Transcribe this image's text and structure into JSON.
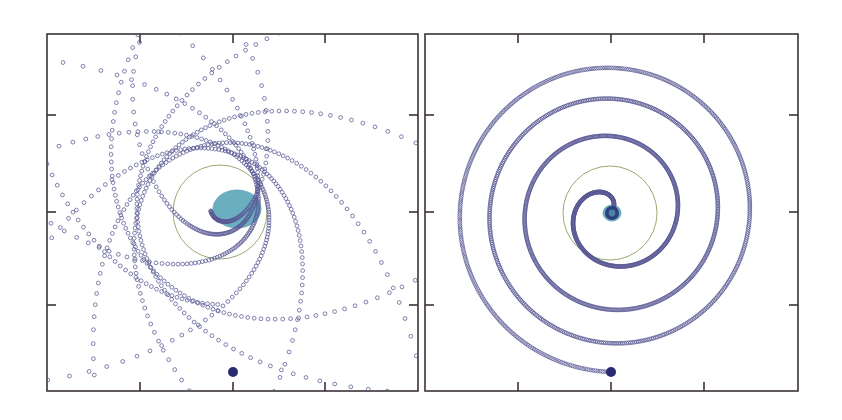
{
  "figure": {
    "caption": "",
    "background_color": "#ffffff",
    "width": 842,
    "height": 420
  },
  "style": {
    "axis_color": "#3a3338",
    "axis_width": 1.6,
    "tick_length": 9,
    "marker_color": "#6a6aa0",
    "marker_stroke_color": "#5a5a95",
    "marker_radius": 1.9,
    "marker_stroke_width": 0.85,
    "start_marker_color": "#2a2a72",
    "start_marker_radius": 5.0,
    "central_body_color": "#6aaec0",
    "central_body_edge_color": "#5d9fb2",
    "reference_circle_color": "#8a9a5a",
    "reference_circle_width": 1.0,
    "inner_core_color": "#2a3a78"
  },
  "chart_data": [
    {
      "id": "left-panel",
      "type": "scatter",
      "title": "",
      "subtitle": "",
      "xlabel": "",
      "ylabel": "",
      "description": "Precessing rosette orbit decaying onto a central body; open-circle markers trace successive eccentric lobes sharing a common focus.",
      "grid": false,
      "legend": null,
      "tick_labels_x": [],
      "tick_labels_y": [],
      "xlim": [
        -1.0,
        1.0
      ],
      "ylim": [
        -1.0,
        1.0
      ],
      "plot_box_px": {
        "x": 47,
        "y": 34,
        "width": 371,
        "height": 357
      },
      "x_ticks_px": [
        140,
        233,
        325
      ],
      "y_ticks_px": [
        115,
        212,
        305
      ],
      "ticks_on": [
        "top",
        "bottom",
        "left",
        "right"
      ],
      "central_body": {
        "cx_px": 237,
        "cy_px": 209,
        "rx_px": 24,
        "ry_px": 19
      },
      "reference_circle": {
        "cx_px": 220,
        "cy_px": 212,
        "r_px": 47
      },
      "start_point_px": {
        "x": 233,
        "y": 372
      },
      "orbit": {
        "kind": "precessing_ellipse_decay",
        "focus_px": {
          "x": 221,
          "y": 211
        },
        "start_semi_latus_px": 174,
        "end_semi_latus_px": 13,
        "eccentricity": 0.86,
        "precession_per_orbit_deg": 41,
        "number_of_orbits": 9.2,
        "theta_start_deg": 92,
        "samples": 1180,
        "marker_spacing": 1
      }
    },
    {
      "id": "right-panel",
      "type": "scatter",
      "title": "",
      "subtitle": "",
      "xlabel": "",
      "ylabel": "",
      "description": "Quasi-circular inspiral: orbital radius decays smoothly from the outer starting radius to the central body.",
      "grid": false,
      "legend": null,
      "tick_labels_x": [],
      "tick_labels_y": [],
      "xlim": [
        -1.0,
        1.0
      ],
      "ylim": [
        -1.0,
        1.0
      ],
      "plot_box_px": {
        "x": 425,
        "y": 34,
        "width": 373,
        "height": 357
      },
      "x_ticks_px": [
        518,
        611,
        704
      ],
      "y_ticks_px": [
        115,
        212,
        305
      ],
      "ticks_on": [
        "top",
        "bottom",
        "left",
        "right"
      ],
      "central_body": {
        "cx_px": 612,
        "cy_px": 213,
        "rx_px": 9,
        "ry_px": 8
      },
      "reference_circle": {
        "cx_px": 610,
        "cy_px": 213,
        "r_px": 47
      },
      "start_point_px": {
        "x": 611,
        "y": 372
      },
      "orbit": {
        "kind": "circular_inspiral",
        "center_px": {
          "x": 612,
          "y": 213
        },
        "start_radius_px": 159,
        "end_radius_px": 4,
        "number_of_turns": 3.55,
        "theta_start_deg": 90,
        "decay_exponent": 0.38,
        "samples": 1500,
        "marker_spacing": 1
      }
    }
  ]
}
